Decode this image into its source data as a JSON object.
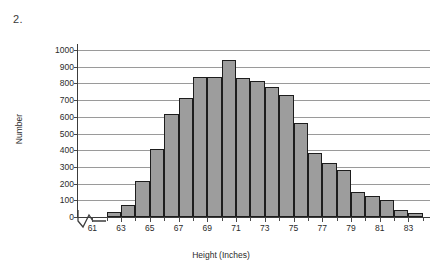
{
  "figure_number": "2.",
  "chart_data": {
    "type": "bar",
    "title": "",
    "xlabel": "Height (Inches)",
    "ylabel": "Number",
    "ylim": [
      0,
      1000
    ],
    "ytick_values": [
      0,
      100,
      200,
      300,
      400,
      500,
      600,
      700,
      800,
      900,
      1000
    ],
    "ytick_labels": [
      "0",
      "100",
      "200",
      "300",
      "400",
      "500",
      "600",
      "700",
      "800",
      "900",
      "1000"
    ],
    "xlim": [
      60,
      84.5
    ],
    "xtick_values": [
      61,
      62,
      63,
      64,
      65,
      66,
      67,
      68,
      69,
      70,
      71,
      72,
      73,
      74,
      75,
      76,
      77,
      78,
      79,
      80,
      81,
      82,
      83,
      84
    ],
    "xtick_labels": [
      "61",
      "",
      "63",
      "",
      "65",
      "",
      "67",
      "",
      "69",
      "",
      "71",
      "",
      "73",
      "",
      "75",
      "",
      "77",
      "",
      "79",
      "",
      "81",
      "",
      "83",
      ""
    ],
    "grid": "horizontal",
    "legend": "none",
    "axis_break": true,
    "bar_width_inches": 1,
    "bin_starts": [
      62,
      63,
      64,
      65,
      66,
      67,
      68,
      69,
      70,
      71,
      72,
      73,
      74,
      75,
      76,
      77,
      78,
      79,
      80,
      81,
      82,
      83
    ],
    "categories": [
      "62-63",
      "63-64",
      "64-65",
      "65-66",
      "66-67",
      "67-68",
      "68-69",
      "69-70",
      "70-71",
      "71-72",
      "72-73",
      "73-74",
      "74-75",
      "75-76",
      "76-77",
      "77-78",
      "78-79",
      "79-80",
      "80-81",
      "81-82",
      "82-83",
      "83-84"
    ],
    "values": [
      30,
      70,
      215,
      410,
      615,
      710,
      840,
      840,
      940,
      830,
      815,
      780,
      730,
      565,
      385,
      325,
      280,
      150,
      125,
      100,
      45,
      25
    ],
    "bar_fill_color": "#9d9d9d",
    "bar_edge_color": "#1d1d1d",
    "gridline_color": "#9a9a9a",
    "axis_color": "#3c3c3c"
  }
}
